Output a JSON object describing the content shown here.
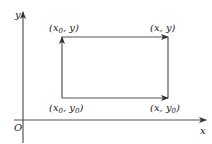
{
  "diagram": {
    "axes": {
      "x_label": "x",
      "y_label": "y",
      "origin_label": "O"
    },
    "points": {
      "top_left": {
        "pre": "(x",
        "sub": "0",
        "post": ", y)"
      },
      "top_right": {
        "text": "(x, y)"
      },
      "bottom_left": {
        "pre": "(x",
        "sub": "0",
        "mid": ", y",
        "sub2": "0",
        "post": ")"
      },
      "bottom_right": {
        "pre": "(x, y",
        "sub": "0",
        "post": ")"
      }
    },
    "colors": {
      "line": "#555555",
      "text": "#222222"
    }
  }
}
